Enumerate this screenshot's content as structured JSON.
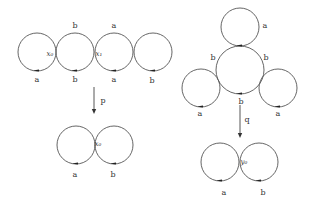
{
  "diagram": {
    "left": {
      "top_chain": {
        "circles": [
          {
            "cx": 37,
            "cy": 52,
            "r": 19
          },
          {
            "cx": 75,
            "cy": 52,
            "r": 19
          },
          {
            "cx": 114,
            "cy": 52,
            "r": 19
          },
          {
            "cx": 153,
            "cy": 52,
            "r": 19
          }
        ],
        "edge_labels": [
          {
            "text": "a",
            "x": 37,
            "y": 80
          },
          {
            "text": "b",
            "x": 75,
            "y": 26
          },
          {
            "text": "b",
            "x": 75,
            "y": 80
          },
          {
            "text": "a",
            "x": 114,
            "y": 26
          },
          {
            "text": "a",
            "x": 114,
            "y": 80
          },
          {
            "text": "b",
            "x": 152,
            "y": 81
          }
        ],
        "vertex_labels": [
          {
            "text": "x₀",
            "x": 50,
            "y": 54
          },
          {
            "text": "x₁",
            "x": 99,
            "y": 54
          }
        ]
      },
      "map": {
        "label": "p",
        "x": 94,
        "y1": 87,
        "y2": 114,
        "label_x": 103,
        "label_y": 101
      },
      "bottom_pair": {
        "circles": [
          {
            "cx": 76,
            "cy": 145,
            "r": 19
          },
          {
            "cx": 114,
            "cy": 145,
            "r": 19
          }
        ],
        "edge_labels": [
          {
            "text": "a",
            "x": 75,
            "y": 175
          },
          {
            "text": "b",
            "x": 113,
            "y": 175
          }
        ],
        "vertex_labels": [
          {
            "text": "x₀",
            "x": 98,
            "y": 144
          }
        ]
      }
    },
    "right": {
      "top_cluster": {
        "circles": [
          {
            "cx": 240,
            "cy": 27,
            "r": 19
          },
          {
            "cx": 240,
            "cy": 70,
            "r": 24
          },
          {
            "cx": 201,
            "cy": 88,
            "r": 19
          },
          {
            "cx": 278,
            "cy": 88,
            "r": 19
          }
        ],
        "edge_labels": [
          {
            "text": "a",
            "x": 265,
            "y": 26
          },
          {
            "text": "b",
            "x": 213,
            "y": 58
          },
          {
            "text": "b",
            "x": 266,
            "y": 58
          },
          {
            "text": "b",
            "x": 241,
            "y": 102
          },
          {
            "text": "a",
            "x": 200,
            "y": 114
          },
          {
            "text": "a",
            "x": 278,
            "y": 114
          }
        ]
      },
      "map": {
        "label": "q",
        "x": 240,
        "y1": 105,
        "y2": 138,
        "label_x": 247,
        "label_y": 120
      },
      "bottom_pair": {
        "circles": [
          {
            "cx": 220,
            "cy": 162,
            "r": 19
          },
          {
            "cx": 259,
            "cy": 162,
            "r": 19
          }
        ],
        "edge_labels": [
          {
            "text": "a",
            "x": 224,
            "y": 193
          },
          {
            "text": "b",
            "x": 263,
            "y": 193
          }
        ],
        "vertex_labels": [
          {
            "text": "y₀",
            "x": 244,
            "y": 162
          }
        ]
      }
    }
  },
  "colors": {
    "stroke": "#555555",
    "text": "#333333",
    "background": "#ffffff"
  }
}
